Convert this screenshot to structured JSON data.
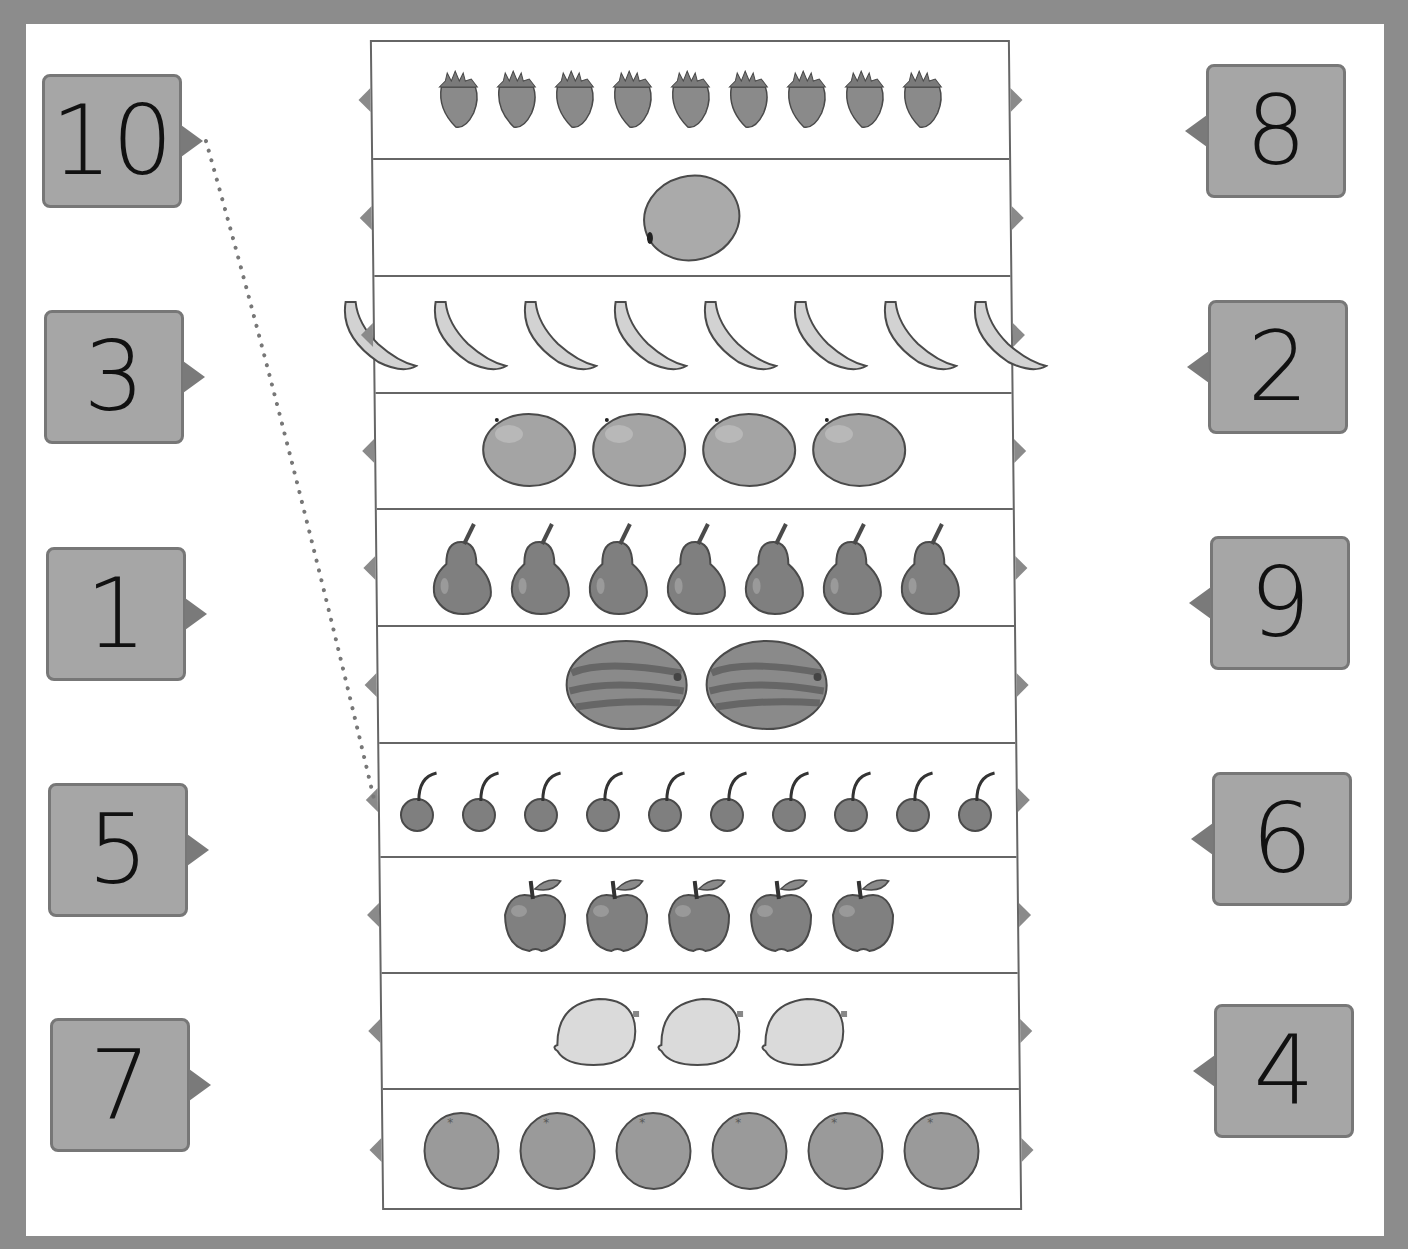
{
  "worksheet": {
    "left_numbers": [
      "10",
      "3",
      "1",
      "5",
      "7"
    ],
    "right_numbers": [
      "8",
      "2",
      "9",
      "6",
      "4"
    ],
    "rows": [
      {
        "fruit": "strawberry",
        "count": 9
      },
      {
        "fruit": "kiwi",
        "count": 1
      },
      {
        "fruit": "banana",
        "count": 8
      },
      {
        "fruit": "mango",
        "count": 4
      },
      {
        "fruit": "pear",
        "count": 7
      },
      {
        "fruit": "watermelon",
        "count": 2
      },
      {
        "fruit": "cherry",
        "count": 10
      },
      {
        "fruit": "apple",
        "count": 5
      },
      {
        "fruit": "lemon",
        "count": 3
      },
      {
        "fruit": "orange",
        "count": 6
      }
    ],
    "example_connection": {
      "from_number": "10",
      "to_row_fruit": "cherry"
    }
  },
  "colors": {
    "border_frame": "#8c8c8c",
    "number_box": "#a6a6a6",
    "fruit_fill": "#8f8f8f"
  }
}
